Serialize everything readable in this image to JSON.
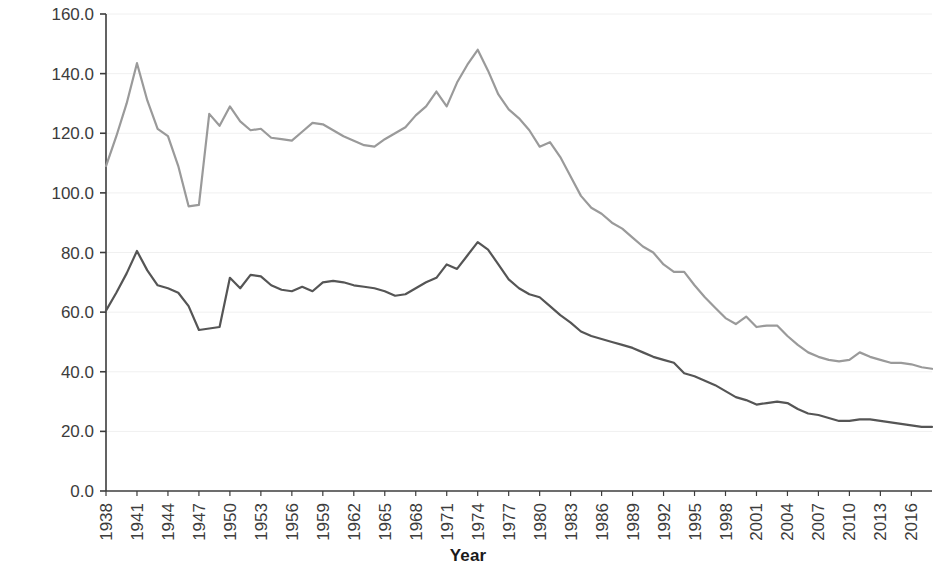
{
  "chart_data": {
    "type": "line",
    "title": "",
    "xlabel": "Year",
    "ylabel": "Marriage rate",
    "xlim": [
      1938,
      2018
    ],
    "ylim": [
      0.0,
      160.0
    ],
    "grid": true,
    "legend": "none",
    "y_ticks": [
      "0.0",
      "20.0",
      "40.0",
      "60.0",
      "80.0",
      "100.0",
      "120.0",
      "140.0",
      "160.0"
    ],
    "y_tick_values": [
      0.0,
      20.0,
      40.0,
      60.0,
      80.0,
      100.0,
      120.0,
      140.0,
      160.0
    ],
    "x_ticks": [
      "1938",
      "1941",
      "1944",
      "1947",
      "1950",
      "1953",
      "1956",
      "1959",
      "1962",
      "1965",
      "1968",
      "1971",
      "1974",
      "1977",
      "1980",
      "1983",
      "1986",
      "1989",
      "1992",
      "1995",
      "1998",
      "2001",
      "2004",
      "2007",
      "2010",
      "2013",
      "2016"
    ],
    "x_tick_values": [
      1938,
      1941,
      1944,
      1947,
      1950,
      1953,
      1956,
      1959,
      1962,
      1965,
      1968,
      1971,
      1974,
      1977,
      1980,
      1983,
      1986,
      1989,
      1992,
      1995,
      1998,
      2001,
      2004,
      2007,
      2010,
      2013,
      2016
    ],
    "x": [
      1938,
      1939,
      1940,
      1941,
      1942,
      1943,
      1944,
      1945,
      1946,
      1947,
      1948,
      1949,
      1950,
      1951,
      1952,
      1953,
      1954,
      1955,
      1956,
      1957,
      1958,
      1959,
      1960,
      1961,
      1962,
      1963,
      1964,
      1965,
      1966,
      1967,
      1968,
      1969,
      1970,
      1971,
      1972,
      1973,
      1974,
      1975,
      1976,
      1977,
      1978,
      1979,
      1980,
      1981,
      1982,
      1983,
      1984,
      1985,
      1986,
      1987,
      1988,
      1989,
      1990,
      1991,
      1992,
      1993,
      1994,
      1995,
      1996,
      1997,
      1998,
      1999,
      2000,
      2001,
      2002,
      2003,
      2004,
      2005,
      2006,
      2007,
      2008,
      2009,
      2010,
      2011,
      2012,
      2013,
      2014,
      2015,
      2016,
      2017,
      2018
    ],
    "series": [
      {
        "name": "upper-series",
        "color": "#9a9a9a",
        "values": [
          109.0,
          119.0,
          130.0,
          143.5,
          131.0,
          121.5,
          119.0,
          109.0,
          95.5,
          96.0,
          126.5,
          122.5,
          129.0,
          124.0,
          121.0,
          121.5,
          118.5,
          118.0,
          117.5,
          120.5,
          123.5,
          123.0,
          121.0,
          119.0,
          117.5,
          116.0,
          115.5,
          118.0,
          120.0,
          122.0,
          126.0,
          129.0,
          134.0,
          129.0,
          137.0,
          143.0,
          148.0,
          141.0,
          133.0,
          128.0,
          125.0,
          121.0,
          115.5,
          117.0,
          112.0,
          105.5,
          99.0,
          95.0,
          93.0,
          90.0,
          88.0,
          85.0,
          82.0,
          80.0,
          76.0,
          73.5,
          73.5,
          69.0,
          65.0,
          61.5,
          58.0,
          56.0,
          58.5,
          55.0,
          55.5,
          55.5,
          52.0,
          49.0,
          46.5,
          45.0,
          44.0,
          43.5,
          44.0,
          46.5,
          45.0,
          44.0,
          43.0,
          43.0,
          42.5,
          41.5,
          41.0
        ]
      },
      {
        "name": "lower-series",
        "color": "#555555",
        "values": [
          60.5,
          66.5,
          73.0,
          80.5,
          74.0,
          69.0,
          68.0,
          66.5,
          62.0,
          54.0,
          54.5,
          55.0,
          71.5,
          68.0,
          72.5,
          72.0,
          69.0,
          67.5,
          67.0,
          68.5,
          67.0,
          70.0,
          70.5,
          70.0,
          69.0,
          68.5,
          68.0,
          67.0,
          65.5,
          66.0,
          68.0,
          70.0,
          71.5,
          76.0,
          74.5,
          79.0,
          83.5,
          81.0,
          76.0,
          71.0,
          68.0,
          66.0,
          65.0,
          62.0,
          59.0,
          56.5,
          53.5,
          52.0,
          51.0,
          50.0,
          49.0,
          48.0,
          46.5,
          45.0,
          44.0,
          43.0,
          39.5,
          38.5,
          37.0,
          35.5,
          33.5,
          31.5,
          30.5,
          29.0,
          29.5,
          30.0,
          29.5,
          27.5,
          26.0,
          25.5,
          24.5,
          23.5,
          23.5,
          24.0,
          24.0,
          23.5,
          23.0,
          22.5,
          22.0,
          21.5,
          21.5
        ]
      }
    ]
  },
  "axes": {
    "x_title": "Year",
    "y_title": "Marriage rate"
  },
  "style": {
    "background": "#ffffff",
    "axis_color": "#3c3c3c",
    "grid_color": "#f0f0f0",
    "tick_color": "#3c3c3c",
    "upper_line_color": "#9a9a9a",
    "lower_line_color": "#555555"
  }
}
